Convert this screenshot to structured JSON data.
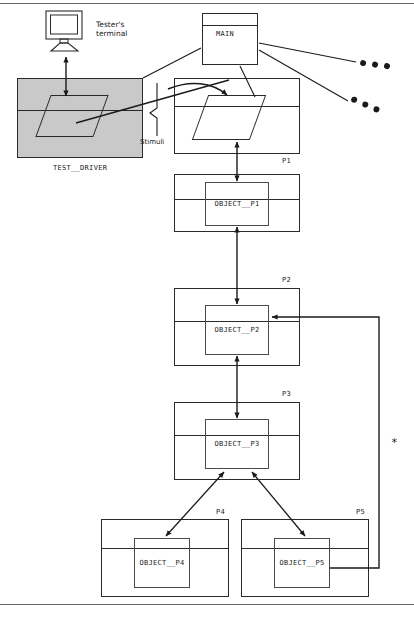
{
  "diagram": {
    "title_hidden": "",
    "modules": [
      {
        "id": "main",
        "label": "MAIN",
        "corner_label": ""
      },
      {
        "id": "test_driver",
        "label": "TEST__DRIVER",
        "corner_label": ""
      },
      {
        "id": "p1",
        "label": "",
        "corner_label": "P1"
      },
      {
        "id": "p2",
        "label": "",
        "corner_label": "P2"
      },
      {
        "id": "p3",
        "label": "",
        "corner_label": "P3"
      },
      {
        "id": "p4",
        "label": "",
        "corner_label": "P4"
      },
      {
        "id": "p5",
        "label": "",
        "corner_label": "P5"
      }
    ],
    "objects": [
      {
        "id": "object_p1",
        "label": "OBJECT__P1"
      },
      {
        "id": "object_p2",
        "label": "OBJECT__P2"
      },
      {
        "id": "object_p3",
        "label": "OBJECT__P3"
      },
      {
        "id": "object_p4",
        "label": "OBJECT__P4"
      },
      {
        "id": "object_p5",
        "label": "OBJECT__P5"
      }
    ],
    "annotations": {
      "tester_terminal_line1": "Tester's",
      "tester_terminal_line2": "terminal",
      "stimuli": "Stimuli",
      "star": "*"
    },
    "ellipses": [
      {
        "id": "ellipsis-upper",
        "text": "• • •"
      },
      {
        "id": "ellipsis-lower",
        "text": "• • •"
      }
    ],
    "colors": {
      "line": "#2a2a2a",
      "shade": "#c9c9c9",
      "rule": "#6a6a6a",
      "background": "#ffffff"
    }
  }
}
